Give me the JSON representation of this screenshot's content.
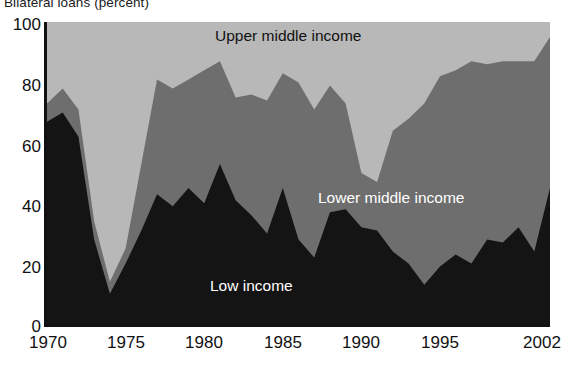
{
  "chart_title": "Bilateral loans (percent)",
  "axis": {
    "y_ticks": [
      "100",
      "80",
      "60",
      "40",
      "20",
      "0"
    ],
    "x_ticks": [
      "1970",
      "1975",
      "1980",
      "1985",
      "1990",
      "1995",
      "2002"
    ]
  },
  "series_labels": {
    "upper": "Upper middle income",
    "lower": "Lower middle income",
    "low": "Low income"
  },
  "colors": {
    "low_income": "#141414",
    "lower_middle_income": "#6e6e6e",
    "upper_middle_income": "#b8b8b8",
    "axis": "#111111",
    "text": "#111111",
    "label_on_dark": "#ffffff"
  },
  "chart_data": {
    "type": "area",
    "stacked": true,
    "title": "Bilateral loans (percent)",
    "xlabel": "",
    "ylabel": "",
    "xlim": [
      1970,
      2002
    ],
    "ylim": [
      0,
      100
    ],
    "grid": false,
    "legend": "inline-labels",
    "x": [
      1970,
      1971,
      1972,
      1973,
      1974,
      1975,
      1976,
      1977,
      1978,
      1979,
      1980,
      1981,
      1982,
      1983,
      1984,
      1985,
      1986,
      1987,
      1988,
      1989,
      1990,
      1991,
      1992,
      1993,
      1994,
      1995,
      1996,
      1997,
      1998,
      1999,
      2000,
      2001,
      2002
    ],
    "series": [
      {
        "name": "Low income",
        "color": "#141414",
        "values": [
          67,
          70,
          62,
          28,
          10,
          20,
          31,
          43,
          39,
          45,
          40,
          53,
          41,
          36,
          30,
          45,
          28,
          22,
          37,
          38,
          32,
          31,
          24,
          20,
          13,
          19,
          23,
          20,
          28,
          27,
          32,
          24,
          45
        ]
      },
      {
        "name": "Lower middle income",
        "color": "#6e6e6e",
        "values": [
          6,
          8,
          9,
          6,
          4,
          5,
          22,
          38,
          39,
          36,
          44,
          34,
          34,
          40,
          44,
          38,
          52,
          49,
          42,
          35,
          18,
          16,
          40,
          48,
          60,
          63,
          61,
          67,
          58,
          60,
          55,
          63,
          50
        ]
      },
      {
        "name": "Upper middle income",
        "color": "#b8b8b8",
        "values": [
          27,
          22,
          29,
          66,
          86,
          75,
          47,
          19,
          22,
          19,
          16,
          13,
          25,
          24,
          26,
          17,
          20,
          29,
          21,
          27,
          50,
          53,
          36,
          32,
          27,
          18,
          16,
          13,
          14,
          13,
          13,
          13,
          5
        ]
      }
    ],
    "cumulative_low": [
      67,
      70,
      62,
      28,
      10,
      20,
      31,
      43,
      39,
      45,
      40,
      53,
      41,
      36,
      30,
      45,
      28,
      22,
      37,
      38,
      32,
      31,
      24,
      20,
      13,
      19,
      23,
      20,
      28,
      27,
      32,
      24,
      45
    ],
    "cumulative_low_plus_lower": [
      73,
      78,
      71,
      34,
      14,
      25,
      53,
      81,
      78,
      81,
      84,
      87,
      75,
      76,
      74,
      83,
      80,
      71,
      79,
      73,
      50,
      47,
      64,
      68,
      73,
      82,
      84,
      87,
      86,
      87,
      87,
      87,
      95
    ]
  }
}
